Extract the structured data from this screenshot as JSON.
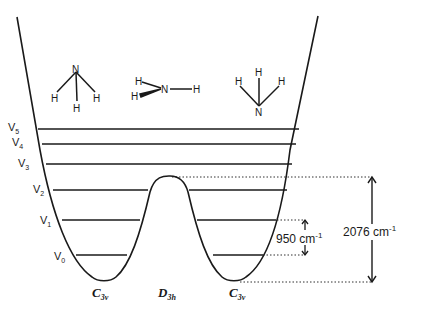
{
  "diagram": {
    "vibrational_levels": [
      {
        "label": "V",
        "sub": "5",
        "y": 129
      },
      {
        "label": "V",
        "sub": "4",
        "y": 144
      },
      {
        "label": "V",
        "sub": "3",
        "y": 164
      },
      {
        "label": "V",
        "sub": "2",
        "y": 190
      },
      {
        "label": "V",
        "sub": "1",
        "y": 220
      },
      {
        "label": "V",
        "sub": "0",
        "y": 255
      }
    ],
    "symmetry_labels": [
      {
        "main": "C",
        "sub": "3v"
      },
      {
        "main": "D",
        "sub": "3h"
      },
      {
        "main": "C",
        "sub": "3v"
      }
    ],
    "molecules": {
      "left": {
        "n": "N",
        "h": [
          "H",
          "H",
          "H"
        ]
      },
      "middle": {
        "n": "N",
        "h": [
          "H",
          "H",
          "H"
        ]
      },
      "right": {
        "n": "N",
        "h": [
          "H",
          "H",
          "H"
        ]
      }
    },
    "annotations": {
      "splitting": {
        "value": "950 cm",
        "exp": "-1"
      },
      "barrier": {
        "value": "2076 cm",
        "exp": "-1"
      }
    },
    "colors": {
      "line": "#1a1a1a",
      "background": "#ffffff"
    }
  }
}
